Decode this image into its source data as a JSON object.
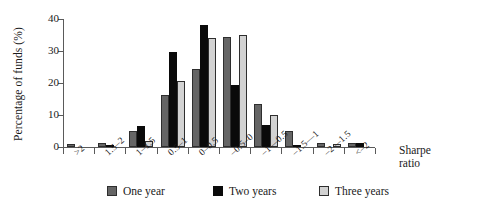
{
  "chart_data": {
    "type": "bar",
    "title": "",
    "xlabel": "Sharpe ratio",
    "ylabel": "Percentage of funds (%)",
    "categories": [
      ">2",
      "1.5–2",
      "1–1.5",
      "0.5–1",
      "0–0.5",
      "–0.5–0",
      "–1––0.5",
      "–1.5––1",
      "–2––1.5",
      "<–2"
    ],
    "series": [
      {
        "name": "One year",
        "color": "#656565",
        "values": [
          1.0,
          1.1,
          5.0,
          16.2,
          24.5,
          34.5,
          13.5,
          5.0,
          1.3,
          1.2
        ]
      },
      {
        "name": "Two years",
        "color": "#0a0a0a",
        "values": [
          0.0,
          0.4,
          6.5,
          29.7,
          38.0,
          19.5,
          7.0,
          0.6,
          0.0,
          1.2
        ]
      },
      {
        "name": "Three years",
        "color": "#d2d2d2",
        "values": [
          0.0,
          0.0,
          1.8,
          20.5,
          34.0,
          35.0,
          10.0,
          0.0,
          1.0,
          0.0
        ]
      }
    ],
    "ylim": [
      0,
      40
    ],
    "yticks": [
      0,
      10,
      20,
      30,
      40
    ],
    "ytick_labels": [
      "0",
      "10",
      "20",
      "30",
      "40"
    ],
    "grid": false,
    "legend_position": "bottom"
  },
  "axes": {
    "y_title": "Percentage of funds (%)",
    "x_title_line1": "Sharpe",
    "x_title_line2": "ratio"
  }
}
